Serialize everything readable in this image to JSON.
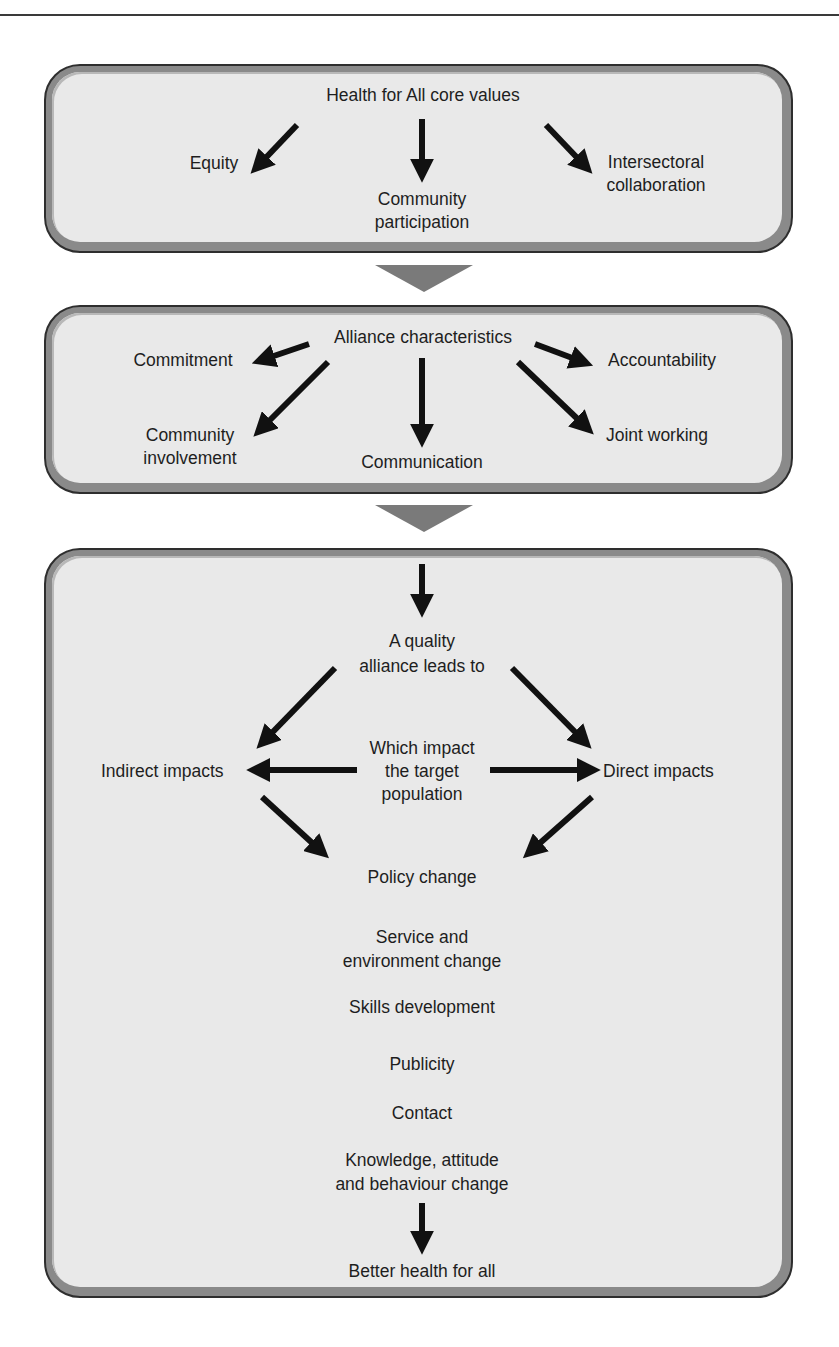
{
  "page": {
    "header_descenders": "gy p p p"
  },
  "panels": [
    {
      "id": "core-values",
      "title": "Health for All core values",
      "items": {
        "equity": "Equity",
        "community_participation_line1": "Community",
        "community_participation_line2": "participation",
        "intersectoral_line1": "Intersectoral",
        "intersectoral_line2": "collaboration"
      }
    },
    {
      "id": "alliance-characteristics",
      "title": "Alliance characteristics",
      "items": {
        "commitment": "Commitment",
        "accountability": "Accountability",
        "community_involvement_line1": "Community",
        "community_involvement_line2": "involvement",
        "communication": "Communication",
        "joint_working": "Joint working"
      }
    },
    {
      "id": "outcomes",
      "quality_line1": "A quality",
      "quality_line2": "alliance leads to",
      "indirect_impacts": "Indirect impacts",
      "direct_impacts": "Direct impacts",
      "which_line1": "Which impact",
      "which_line2": "the target",
      "which_line3": "population",
      "outcome_list": [
        "Policy change",
        "Service and",
        "environment change",
        "Skills development",
        "Publicity",
        "Contact",
        "Knowledge, attitude",
        "and behaviour change"
      ],
      "final": "Better health for all"
    }
  ],
  "colors": {
    "panel_fill": "#e9e9e9",
    "panel_border": "#8a8a8a",
    "panel_outline": "#2e2e2e",
    "connector": "#7a7a7a",
    "arrow": "#111111",
    "text": "#1e1e1e"
  }
}
